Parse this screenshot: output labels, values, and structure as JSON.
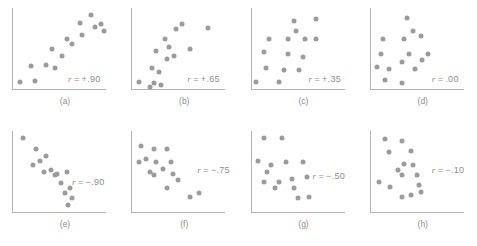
{
  "figure": {
    "rows": 2,
    "columns": 4,
    "dot_color": "#9b9b9b",
    "axis_color": "#b4b4b4",
    "background": "#ffffff"
  },
  "chart_data": {
    "type": "scatter",
    "title": "",
    "xlabel": "",
    "ylabel": "",
    "grid": false,
    "legend": "none",
    "xlim": [
      0,
      100
    ],
    "ylim": [
      0,
      100
    ],
    "panels": [
      {
        "id": "a",
        "caption": "(a)",
        "r_label": "r = +.90",
        "r_value": 0.9,
        "label_x": 56,
        "label_y": 66,
        "points": [
          [
            8,
            10
          ],
          [
            24,
            11
          ],
          [
            20,
            29
          ],
          [
            36,
            30
          ],
          [
            46,
            27
          ],
          [
            43,
            50
          ],
          [
            53,
            42
          ],
          [
            59,
            62
          ],
          [
            64,
            56
          ],
          [
            74,
            67
          ],
          [
            72,
            82
          ],
          [
            84,
            92
          ],
          [
            88,
            77
          ],
          [
            95,
            80
          ],
          [
            98,
            72
          ]
        ]
      },
      {
        "id": "b",
        "caption": "(b)",
        "r_label": "r = +.65",
        "r_value": 0.65,
        "label_x": 56,
        "label_y": 66,
        "points": [
          [
            8,
            10
          ],
          [
            20,
            4
          ],
          [
            24,
            9
          ],
          [
            32,
            6
          ],
          [
            22,
            27
          ],
          [
            30,
            22
          ],
          [
            26,
            47
          ],
          [
            38,
            38
          ],
          [
            40,
            52
          ],
          [
            36,
            62
          ],
          [
            46,
            42
          ],
          [
            48,
            74
          ],
          [
            54,
            80
          ],
          [
            62,
            50
          ],
          [
            82,
            76
          ]
        ]
      },
      {
        "id": "c",
        "caption": "(c)",
        "r_label": "r = +.35",
        "r_value": 0.35,
        "label_x": 58,
        "label_y": 66,
        "points": [
          [
            6,
            10
          ],
          [
            30,
            10
          ],
          [
            16,
            27
          ],
          [
            36,
            25
          ],
          [
            52,
            24
          ],
          [
            14,
            46
          ],
          [
            40,
            44
          ],
          [
            56,
            40
          ],
          [
            20,
            62
          ],
          [
            40,
            62
          ],
          [
            58,
            62
          ],
          [
            46,
            84
          ],
          [
            48,
            72
          ],
          [
            70,
            86
          ],
          [
            70,
            62
          ]
        ]
      },
      {
        "id": "d",
        "caption": "(d)",
        "r_label": "r = .00",
        "r_value": 0.0,
        "label_x": 62,
        "label_y": 66,
        "points": [
          [
            16,
            12
          ],
          [
            34,
            8
          ],
          [
            8,
            28
          ],
          [
            20,
            26
          ],
          [
            12,
            44
          ],
          [
            34,
            34
          ],
          [
            48,
            26
          ],
          [
            42,
            44
          ],
          [
            56,
            36
          ],
          [
            62,
            44
          ],
          [
            14,
            62
          ],
          [
            36,
            62
          ],
          [
            46,
            72
          ],
          [
            54,
            66
          ],
          [
            40,
            88
          ]
        ]
      },
      {
        "id": "e",
        "caption": "(e)",
        "r_label": "r = −.90",
        "r_value": -0.9,
        "label_x": 60,
        "label_y": 46,
        "points": [
          [
            12,
            92
          ],
          [
            26,
            78
          ],
          [
            36,
            70
          ],
          [
            22,
            58
          ],
          [
            34,
            50
          ],
          [
            46,
            46
          ],
          [
            52,
            36
          ],
          [
            58,
            50
          ],
          [
            56,
            24
          ],
          [
            62,
            30
          ],
          [
            64,
            18
          ],
          [
            60,
            10
          ],
          [
            48,
            48
          ],
          [
            42,
            52
          ],
          [
            30,
            64
          ]
        ]
      },
      {
        "id": "f",
        "caption": "(f)",
        "r_label": "r = −.75",
        "r_value": -0.75,
        "label_x": 66,
        "label_y": 34,
        "points": [
          [
            10,
            82
          ],
          [
            24,
            78
          ],
          [
            38,
            78
          ],
          [
            8,
            62
          ],
          [
            26,
            62
          ],
          [
            42,
            62
          ],
          [
            20,
            50
          ],
          [
            24,
            46
          ],
          [
            44,
            48
          ],
          [
            38,
            30
          ],
          [
            62,
            20
          ],
          [
            72,
            24
          ],
          [
            16,
            66
          ],
          [
            34,
            54
          ],
          [
            50,
            40
          ]
        ]
      },
      {
        "id": "g",
        "caption": "(g)",
        "r_label": "r = −.50",
        "r_value": -0.5,
        "label_x": 62,
        "label_y": 40,
        "points": [
          [
            14,
            92
          ],
          [
            34,
            92
          ],
          [
            8,
            64
          ],
          [
            22,
            58
          ],
          [
            38,
            62
          ],
          [
            56,
            62
          ],
          [
            18,
            50
          ],
          [
            14,
            38
          ],
          [
            30,
            38
          ],
          [
            44,
            42
          ],
          [
            60,
            44
          ],
          [
            26,
            30
          ],
          [
            46,
            30
          ],
          [
            50,
            18
          ],
          [
            62,
            20
          ]
        ]
      },
      {
        "id": "h",
        "caption": "(h)",
        "r_label": "r = −.10",
        "r_value": -0.1,
        "label_x": 62,
        "label_y": 34,
        "points": [
          [
            16,
            90
          ],
          [
            34,
            88
          ],
          [
            20,
            74
          ],
          [
            44,
            76
          ],
          [
            36,
            60
          ],
          [
            34,
            46
          ],
          [
            50,
            46
          ],
          [
            10,
            38
          ],
          [
            22,
            32
          ],
          [
            52,
            34
          ],
          [
            54,
            26
          ],
          [
            34,
            20
          ],
          [
            44,
            22
          ],
          [
            30,
            52
          ],
          [
            46,
            58
          ]
        ]
      }
    ]
  }
}
